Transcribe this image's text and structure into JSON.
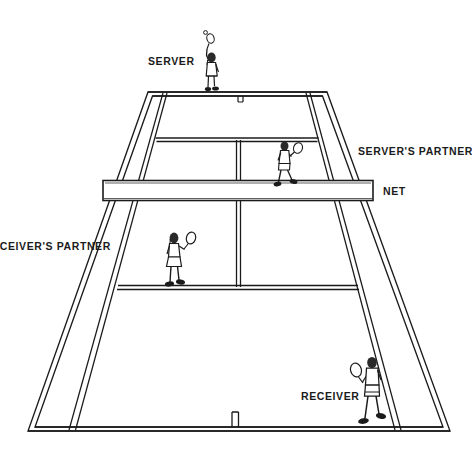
{
  "diagram": {
    "type": "tennis-court-doubles-positions",
    "line_color": "#1b1b1b",
    "court_fill": "#ffffff",
    "background": "#ffffff"
  },
  "labels": {
    "server": "SERVER",
    "servers_partner": "SERVER'S PARTNER",
    "net": "NET",
    "receivers_partner": "RECEIVER'S PARTNER",
    "receiver": "RECEIVER"
  },
  "players": [
    {
      "name": "server",
      "label": "SERVER",
      "position": "far baseline, center-left",
      "pose": "serving, racket raised overhead with ball tossed",
      "x": 210,
      "y": 60
    },
    {
      "name": "servers-partner",
      "label": "SERVER'S PARTNER",
      "position": "far court, right service box near net",
      "pose": "ready stance, racket held forward",
      "x": 290,
      "y": 165
    },
    {
      "name": "receivers-partner",
      "label": "RECEIVER'S PARTNER",
      "position": "near court, left service box",
      "pose": "ready stance, racket raised",
      "x": 178,
      "y": 257
    },
    {
      "name": "receiver",
      "label": "RECEIVER",
      "position": "near baseline, right side",
      "pose": "crouched ready to return serve",
      "x": 372,
      "y": 390
    }
  ],
  "court_elements": {
    "net": "NET",
    "far_baseline": "far baseline",
    "near_baseline": "near baseline",
    "far_service_line": "far service line",
    "near_service_line": "near service line",
    "center_service_line": "center service line",
    "center_mark": "center mark",
    "doubles_sideline_left": "left doubles sideline",
    "doubles_sideline_right": "right doubles sideline",
    "singles_sideline_left": "left singles sideline",
    "singles_sideline_right": "right singles sideline"
  }
}
